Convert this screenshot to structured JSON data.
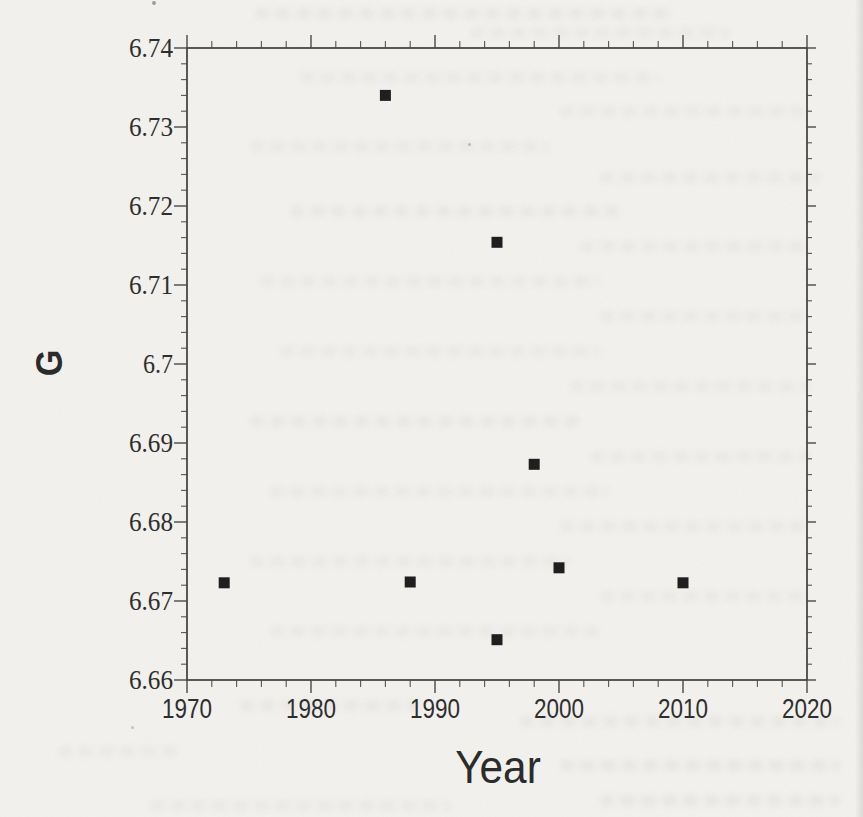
{
  "page": {
    "kind": "scanned book page with scatter plot",
    "paper_color": "#f3f2ef",
    "ink_color": "#2b2b2b"
  },
  "chart_data": {
    "type": "scatter",
    "title": "",
    "xlabel": "Year",
    "ylabel": "G",
    "xlim": [
      1970,
      2020
    ],
    "ylim": [
      6.66,
      6.74
    ],
    "x_tick_values": [
      1970,
      1980,
      1990,
      2000,
      2010,
      2020
    ],
    "x_tick_labels": [
      "1970",
      "1980",
      "1990",
      "2000",
      "2010",
      "2020"
    ],
    "y_tick_values": [
      6.66,
      6.67,
      6.68,
      6.69,
      6.7,
      6.71,
      6.72,
      6.73,
      6.74
    ],
    "y_tick_labels": [
      "6.66",
      "6.67",
      "6.68",
      "6.69",
      "6.7",
      "6.71",
      "6.72",
      "6.73",
      "6.74"
    ],
    "x_minor_step": 2,
    "y_minor_step": 0.002,
    "grid": false,
    "legend": null,
    "marker": "filled-square",
    "marker_size_px": 11,
    "marker_color": "#1f1f1f",
    "frame_color": "#474747",
    "tick_color": "#555555",
    "label_color": "#2e2e2e",
    "points": [
      {
        "year": 1973,
        "G": 6.6723
      },
      {
        "year": 1986,
        "G": 6.734
      },
      {
        "year": 1988,
        "G": 6.6724
      },
      {
        "year": 1995,
        "G": 6.7154
      },
      {
        "year": 1995,
        "G": 6.6651
      },
      {
        "year": 1998,
        "G": 6.6873
      },
      {
        "year": 2000,
        "G": 6.6742
      },
      {
        "year": 2010,
        "G": 6.6723
      }
    ]
  }
}
